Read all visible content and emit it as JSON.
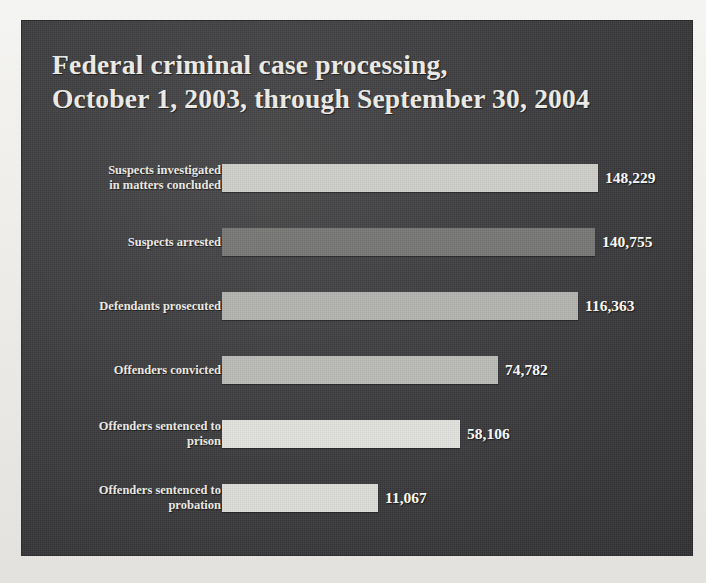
{
  "figure": {
    "background_color": "#eceae6",
    "panel_color": "#3e3e40",
    "title_line_1": "Federal criminal case processing,",
    "title_line_2": "October 1, 2003, through September 30, 2004"
  },
  "chart_data": {
    "type": "bar",
    "orientation": "horizontal",
    "title": "Federal criminal case processing, October 1, 2003, through September 30, 2004",
    "xlabel": "",
    "ylabel": "",
    "grid": false,
    "legend": "none",
    "axis_visible": false,
    "value_labels": true,
    "categories": [
      "Suspects investigated in matters concluded",
      "Suspects arrested",
      "Defendants prosecuted",
      "Offenders convicted",
      "Offenders sentenced to prison",
      "Offenders sentenced to probation"
    ],
    "values": [
      148229,
      140755,
      116363,
      74782,
      58106,
      11067
    ],
    "value_labels_text": [
      "148,229",
      "140,755",
      "116,363",
      "74,782",
      "58,106",
      "11,067"
    ],
    "bars": [
      {
        "category_line_1": "Suspects investigated",
        "category_line_2": "in matters concluded",
        "value": 148229,
        "value_label": "148,229",
        "bar_px_width": 376,
        "color": "#cfcfcb"
      },
      {
        "category_line_1": "Suspects arrested",
        "category_line_2": "",
        "value": 140755,
        "value_label": "140,755",
        "bar_px_width": 373,
        "color": "#797a78"
      },
      {
        "category_line_1": "Defendants prosecuted",
        "category_line_2": "",
        "value": 116363,
        "value_label": "116,363",
        "bar_px_width": 356,
        "color": "#b4b5b1"
      },
      {
        "category_line_1": "Offenders convicted",
        "category_line_2": "",
        "value": 74782,
        "value_label": "74,782",
        "bar_px_width": 276,
        "color": "#bcbdb9"
      },
      {
        "category_line_1": "Offenders sentenced to",
        "category_line_2": "prison",
        "value": 58106,
        "value_label": "58,106",
        "bar_px_width": 238,
        "color": "#e3e3df"
      },
      {
        "category_line_1": "Offenders sentenced to",
        "category_line_2": "probation",
        "value": 11067,
        "value_label": "11,067",
        "bar_px_width": 156,
        "color": "#dedfda"
      }
    ]
  }
}
